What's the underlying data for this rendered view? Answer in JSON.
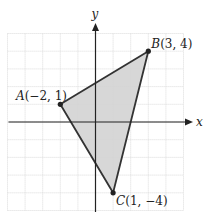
{
  "diagram": {
    "type": "coordinate-plane-triangle",
    "axes": {
      "x_label": "x",
      "y_label": "y",
      "x_range": [
        -5,
        5
      ],
      "y_range": [
        -5,
        5
      ],
      "grid": true,
      "grid_step": 1
    },
    "points": [
      {
        "name": "A",
        "x": -2,
        "y": 1,
        "label": "A(−2, 1)",
        "label_letter": "A",
        "label_coords": "(−2, 1)"
      },
      {
        "name": "B",
        "x": 3,
        "y": 4,
        "label": "B(3, 4)",
        "label_letter": "B",
        "label_coords": "(3, 4)"
      },
      {
        "name": "C",
        "x": 1,
        "y": -4,
        "label": "C(1, −4)",
        "label_letter": "C",
        "label_coords": "(1, −4)"
      }
    ],
    "colors": {
      "fill": "#d3d3d3",
      "grid": "#d9d9d9",
      "edge": "#333333",
      "axis": "#222222",
      "point": "#222222"
    }
  }
}
